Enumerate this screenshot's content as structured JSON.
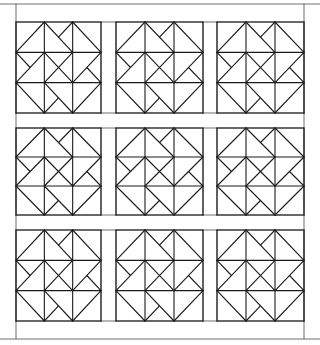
{
  "diagram": {
    "title": "",
    "type": "quilt-pattern",
    "canvas": {
      "width": 320,
      "height": 345,
      "background": "#ffffff"
    },
    "line_color": "#1a1a1a",
    "frame_color": "#6e6e6e",
    "outer_border": {
      "left": 0,
      "top": 4,
      "right": 320,
      "bottom": 339
    },
    "side_rails": {
      "left_x": 16,
      "right_x": 304
    },
    "block_columns": [
      [
        16,
        101
      ],
      [
        116,
        203
      ],
      [
        217,
        304
      ]
    ],
    "block_rows": [
      [
        22,
        113
      ],
      [
        128,
        215
      ],
      [
        230,
        321
      ]
    ],
    "block_grid": 3,
    "block_count": 9,
    "block_lines": [
      [
        0,
        0,
        3,
        0
      ],
      [
        3,
        0,
        3,
        3
      ],
      [
        3,
        3,
        0,
        3
      ],
      [
        0,
        3,
        0,
        0
      ],
      [
        1,
        0,
        1,
        3
      ],
      [
        2,
        0,
        2,
        3
      ],
      [
        0,
        1,
        3,
        1
      ],
      [
        0,
        2,
        3,
        2
      ],
      [
        1,
        0,
        0,
        1
      ],
      [
        2,
        0,
        3,
        1
      ],
      [
        3,
        2,
        2,
        3
      ],
      [
        1,
        3,
        0,
        2
      ],
      [
        1,
        0,
        2,
        1
      ],
      [
        3,
        1,
        2,
        2
      ],
      [
        2,
        3,
        1,
        2
      ],
      [
        0,
        2,
        1,
        1
      ],
      [
        1,
        1,
        2,
        2
      ],
      [
        2,
        1,
        1,
        2
      ],
      [
        2,
        0,
        1.5,
        0.5
      ],
      [
        3,
        2,
        2.5,
        1.5
      ],
      [
        1,
        3,
        1.5,
        2.5
      ],
      [
        0,
        1,
        0.5,
        1.5
      ]
    ]
  }
}
